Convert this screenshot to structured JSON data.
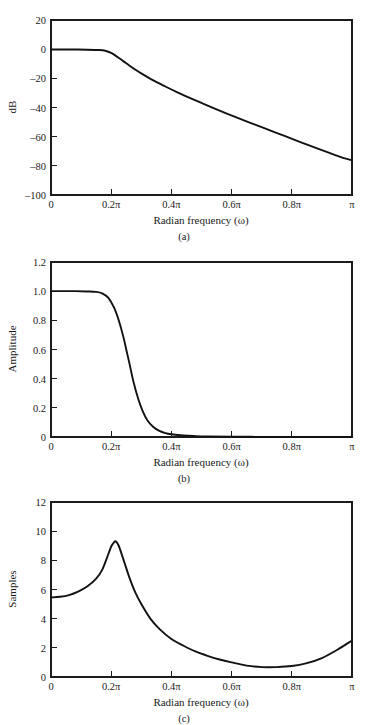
{
  "figure": {
    "background": "#ffffff",
    "curve_color": "#121212",
    "axis_color": "#1c1c1c"
  },
  "panels": [
    {
      "id": "a",
      "caption": "(a)",
      "xlabel": "Radian frequency (ω)",
      "ylabel": "dB",
      "xticks": [
        "0",
        "0.2π",
        "0.4π",
        "0.6π",
        "0.8π",
        "π"
      ],
      "yticks": [
        "20",
        "0",
        "–20",
        "–40",
        "–60",
        "–80",
        "–100"
      ]
    },
    {
      "id": "b",
      "caption": "(b)",
      "xlabel": "Radian frequency (ω)",
      "ylabel": "Amplitude",
      "xticks": [
        "0",
        "0.2π",
        "0.4π",
        "0.6π",
        "0.8π",
        "π"
      ],
      "yticks": [
        "1.2",
        "1.0",
        "0.8",
        "0.6",
        "0.4",
        "0.2",
        "0"
      ]
    },
    {
      "id": "c",
      "caption": "(c)",
      "xlabel": "Radian frequency (ω)",
      "ylabel": "Samples",
      "xticks": [
        "0",
        "0.2π",
        "0.4π",
        "0.6π",
        "0.8π",
        "π"
      ],
      "yticks": [
        "12",
        "10",
        "8",
        "6",
        "4",
        "2",
        "0"
      ]
    }
  ],
  "chart_data": [
    {
      "type": "line",
      "title": "",
      "subtitle": "(a)",
      "xlabel": "Radian frequency (ω)",
      "ylabel": "dB",
      "xlim": [
        0,
        1
      ],
      "ylim": [
        -100,
        20
      ],
      "xtick_values": [
        0,
        0.2,
        0.4,
        0.6,
        0.8,
        1
      ],
      "xtick_labels": [
        "0",
        "0.2π",
        "0.4π",
        "0.6π",
        "0.8π",
        "π"
      ],
      "ytick_values": [
        20,
        0,
        -20,
        -40,
        -60,
        -80,
        -100
      ],
      "ytick_labels": [
        "20",
        "0",
        "–20",
        "–40",
        "–60",
        "–80",
        "–100"
      ],
      "grid": false,
      "legend": "none",
      "series": [
        {
          "name": "magnitude-response-db",
          "x": [
            0,
            0.04,
            0.08,
            0.12,
            0.16,
            0.18,
            0.2,
            0.22,
            0.24,
            0.26,
            0.28,
            0.3,
            0.34,
            0.38,
            0.42,
            0.46,
            0.5,
            0.54,
            0.58,
            0.62,
            0.66,
            0.7,
            0.74,
            0.78,
            0.82,
            0.86,
            0.9,
            0.94,
            0.97,
            1.0
          ],
          "y": [
            -0.2,
            -0.2,
            -0.25,
            -0.35,
            -0.6,
            -1.1,
            -2.6,
            -5.2,
            -8.2,
            -11.2,
            -14.0,
            -16.6,
            -21.4,
            -25.6,
            -29.6,
            -33.3,
            -36.9,
            -40.4,
            -43.8,
            -47.1,
            -50.3,
            -53.5,
            -56.7,
            -59.8,
            -63.0,
            -66.2,
            -69.3,
            -72.3,
            -74.5,
            -76.2
          ]
        }
      ]
    },
    {
      "type": "line",
      "title": "",
      "subtitle": "(b)",
      "xlabel": "Radian frequency (ω)",
      "ylabel": "Amplitude",
      "xlim": [
        0,
        1
      ],
      "ylim": [
        0,
        1.2
      ],
      "xtick_values": [
        0,
        0.2,
        0.4,
        0.6,
        0.8,
        1
      ],
      "xtick_labels": [
        "0",
        "0.2π",
        "0.4π",
        "0.6π",
        "0.8π",
        "π"
      ],
      "ytick_values": [
        1.2,
        1.0,
        0.8,
        0.6,
        0.4,
        0.2,
        0
      ],
      "ytick_labels": [
        "1.2",
        "1.0",
        "0.8",
        "0.6",
        "0.4",
        "0.2",
        "0"
      ],
      "grid": false,
      "legend": "none",
      "series": [
        {
          "name": "amplitude-response",
          "x": [
            0,
            0.04,
            0.08,
            0.12,
            0.15,
            0.17,
            0.19,
            0.21,
            0.225,
            0.24,
            0.25,
            0.26,
            0.275,
            0.29,
            0.305,
            0.32,
            0.34,
            0.36,
            0.38,
            0.4,
            0.44,
            0.48,
            0.52,
            0.6,
            0.7,
            0.8,
            0.9,
            1.0
          ],
          "y": [
            1.0,
            1.0,
            1.0,
            0.998,
            0.995,
            0.985,
            0.955,
            0.885,
            0.8,
            0.69,
            0.6,
            0.51,
            0.37,
            0.26,
            0.175,
            0.115,
            0.068,
            0.042,
            0.027,
            0.019,
            0.01,
            0.006,
            0.004,
            0.002,
            0.001,
            0.001,
            0.001,
            0.001
          ]
        }
      ]
    },
    {
      "type": "line",
      "title": "",
      "subtitle": "(c)",
      "xlabel": "Radian frequency (ω)",
      "ylabel": "Samples",
      "xlim": [
        0,
        1
      ],
      "ylim": [
        0,
        12
      ],
      "xtick_values": [
        0,
        0.2,
        0.4,
        0.6,
        0.8,
        1
      ],
      "xtick_labels": [
        "0",
        "0.2π",
        "0.4π",
        "0.6π",
        "0.8π",
        "π"
      ],
      "ytick_values": [
        12,
        10,
        8,
        6,
        4,
        2,
        0
      ],
      "ytick_labels": [
        "12",
        "10",
        "8",
        "6",
        "4",
        "2",
        "0"
      ],
      "grid": false,
      "legend": "none",
      "series": [
        {
          "name": "group-delay-samples",
          "x": [
            0,
            0.03,
            0.06,
            0.09,
            0.12,
            0.15,
            0.17,
            0.19,
            0.2,
            0.21,
            0.215,
            0.225,
            0.24,
            0.26,
            0.28,
            0.3,
            0.33,
            0.36,
            0.4,
            0.44,
            0.48,
            0.52,
            0.56,
            0.6,
            0.65,
            0.7,
            0.75,
            0.8,
            0.85,
            0.9,
            0.95,
            1.0
          ],
          "y": [
            5.45,
            5.5,
            5.62,
            5.85,
            6.2,
            6.75,
            7.35,
            8.4,
            8.95,
            9.25,
            9.3,
            9.0,
            8.1,
            6.85,
            5.8,
            5.0,
            4.0,
            3.3,
            2.6,
            2.15,
            1.75,
            1.45,
            1.2,
            1.0,
            0.78,
            0.68,
            0.68,
            0.75,
            0.95,
            1.3,
            1.85,
            2.5
          ]
        }
      ]
    }
  ]
}
